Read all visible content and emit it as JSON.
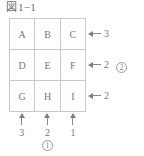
{
  "figure": {
    "kanji_prefix": "図",
    "number_label": "1−1"
  },
  "grid": {
    "cells": [
      {
        "label": "A"
      },
      {
        "label": "B"
      },
      {
        "label": "C"
      },
      {
        "label": "D"
      },
      {
        "label": "E"
      },
      {
        "label": "F"
      },
      {
        "label": "G"
      },
      {
        "label": "H"
      },
      {
        "label": "I"
      }
    ]
  },
  "row_annotations": [
    {
      "arrow": "arrow-left-icon",
      "value": "3",
      "marker": ""
    },
    {
      "arrow": "arrow-left-icon",
      "value": "2",
      "marker": "2"
    },
    {
      "arrow": "arrow-left-icon",
      "value": "2",
      "marker": ""
    }
  ],
  "col_annotations": [
    {
      "arrow": "arrow-up-icon",
      "value": "3"
    },
    {
      "arrow": "arrow-up-icon",
      "value": "2"
    },
    {
      "arrow": "arrow-up-icon",
      "value": "1"
    }
  ],
  "markers": {
    "column_marker": "1"
  },
  "colors": {
    "border": "#c9c9c9",
    "text": "#787878",
    "arrow": "#7d7d7d",
    "background": "#ffffff"
  }
}
